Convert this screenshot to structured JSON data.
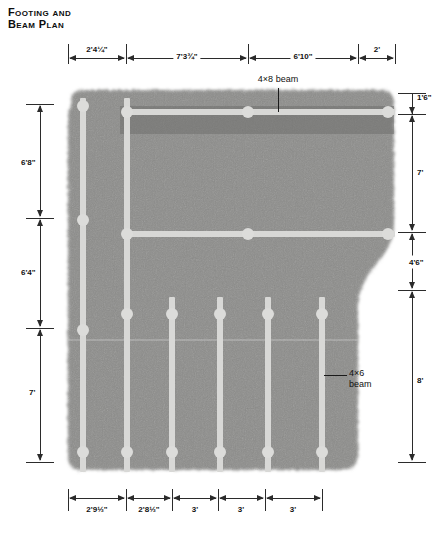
{
  "title": {
    "line1": "Footing and",
    "line2": "Beam Plan"
  },
  "drawing": {
    "type": "architectural-plan",
    "description": "Foundation footing and beam plan over concrete slab",
    "slab_color": "#8a8a88",
    "beam_color": "#d8d8d6"
  },
  "dimensions": {
    "top": [
      {
        "label": "2'4¼\"",
        "x1": 68,
        "x2": 126
      },
      {
        "label": "7'3¾\"",
        "x1": 126,
        "x2": 248
      },
      {
        "label": "6'10\"",
        "x1": 248,
        "x2": 358
      },
      {
        "label": "2'",
        "x1": 358,
        "x2": 395
      }
    ],
    "left": [
      {
        "label": "6'8\"",
        "y1": 104,
        "y2": 218
      },
      {
        "label": "6'4\"",
        "y1": 218,
        "y2": 328
      },
      {
        "label": "7'",
        "y1": 328,
        "y2": 462
      }
    ],
    "right": [
      {
        "label": "1'6\"",
        "y1": 93,
        "y2": 114
      },
      {
        "label": "7'",
        "y1": 114,
        "y2": 232
      },
      {
        "label": "4'6\"",
        "y1": 232,
        "y2": 290
      },
      {
        "label": "8'",
        "y1": 290,
        "y2": 462
      }
    ],
    "bottom": [
      {
        "label": "2'9½\"",
        "x1": 68,
        "x2": 126
      },
      {
        "label": "2'8½\"",
        "x1": 126,
        "x2": 172
      },
      {
        "label": "3'",
        "x1": 172,
        "x2": 218
      },
      {
        "label": "3'",
        "x1": 218,
        "x2": 265
      },
      {
        "label": "3'",
        "x1": 265,
        "x2": 322
      }
    ]
  },
  "callouts": [
    {
      "name": "beam-callout-4x8",
      "text": "4×8 beam",
      "line2": ""
    },
    {
      "name": "beam-callout-4x6",
      "text": "4×6",
      "line2": "beam"
    }
  ]
}
